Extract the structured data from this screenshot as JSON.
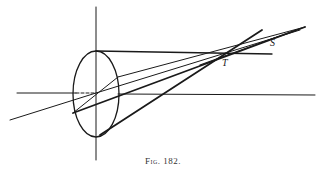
{
  "figure": {
    "caption": "Fig. 182.",
    "labels": {
      "point_t": "T",
      "point_s": "S"
    }
  }
}
